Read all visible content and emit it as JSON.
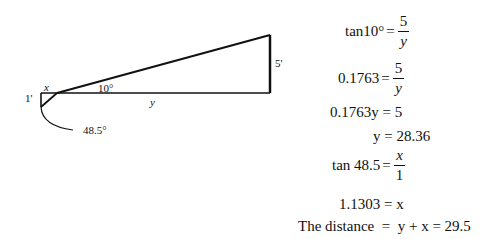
{
  "diagram": {
    "labels": {
      "x": "x",
      "y": "y",
      "one_ft": "1'",
      "five_ft": "5'",
      "angle_small": "10°",
      "angle_large": "48.5°"
    },
    "colors": {
      "stroke": "#111111",
      "background": "#ffffff"
    }
  },
  "equations": {
    "eq1": {
      "lhs": "tan10°",
      "eq": "=",
      "num": "5",
      "den": "y"
    },
    "eq2": {
      "lhs": "0.1763",
      "eq": "=",
      "num": "5",
      "den": "y"
    },
    "eq3": {
      "text": "0.1763y = 5"
    },
    "eq4": {
      "text": "y = 28.36"
    },
    "eq5": {
      "lhs": "tan 48.5",
      "eq": "=",
      "num": "x",
      "den": "1"
    },
    "eq6": {
      "text": "1.1303 = x"
    },
    "eq7": {
      "text": "The distance  =  y + x = 29.5"
    }
  }
}
